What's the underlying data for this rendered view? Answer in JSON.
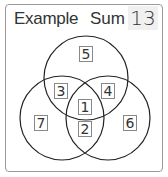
{
  "header": {
    "title": "Example",
    "sum_label": "Sum",
    "sum_value": "13"
  },
  "venn": {
    "circles": [
      {
        "name": "top",
        "cx": 86,
        "cy": 78,
        "r": 42
      },
      {
        "name": "left",
        "cx": 62,
        "cy": 118,
        "r": 42
      },
      {
        "name": "right",
        "cx": 108,
        "cy": 118,
        "r": 42
      }
    ],
    "regions": {
      "top_only": "5",
      "top_left": "3",
      "top_right": "4",
      "center": "1",
      "left_right": "2",
      "left_only": "7",
      "right_only": "6"
    },
    "stroke_color": "#222222"
  }
}
